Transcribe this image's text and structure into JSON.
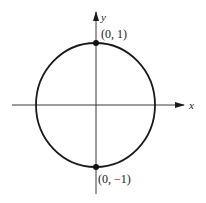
{
  "diagram": {
    "colors": {
      "stroke": "#1a1a1a",
      "axis": "#3a3a3a",
      "background": "#ffffff"
    },
    "axes": {
      "x_label": "x",
      "y_label": "y"
    },
    "circle": {
      "center": [
        0,
        0
      ],
      "radius": 1
    },
    "points": [
      {
        "label": "(0, 1)",
        "x": 0,
        "y": 1
      },
      {
        "label": "(0, −1)",
        "x": 0,
        "y": -1
      }
    ]
  }
}
